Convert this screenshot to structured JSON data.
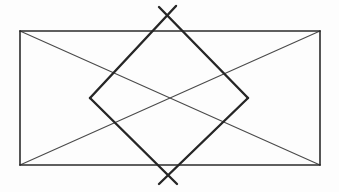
{
  "figure": {
    "kind": "geometric-line-drawing",
    "canvas": {
      "width": 339,
      "height": 192,
      "background": "#fdfdfd"
    },
    "style": {
      "rectangle_stroke": "#2b2b2b",
      "rectangle_stroke_width": 1.6,
      "diagonal_stroke": "#4a4a4a",
      "diagonal_stroke_width": 1.1,
      "diamond_stroke": "#262626",
      "diamond_stroke_width": 2.4,
      "line_cap": "round"
    },
    "rectangle": {
      "label": "outer-rectangle",
      "left": 20,
      "top": 31,
      "right": 320,
      "bottom": 165,
      "width": 300,
      "height": 134,
      "corners": [
        {
          "name": "top-left",
          "x": 20,
          "y": 31
        },
        {
          "name": "top-right",
          "x": 320,
          "y": 31
        },
        {
          "name": "bottom-right",
          "x": 320,
          "y": 165
        },
        {
          "name": "bottom-left",
          "x": 20,
          "y": 165
        }
      ]
    },
    "diagonals": [
      {
        "name": "diagonal-tl-br",
        "x1": 20,
        "y1": 31,
        "x2": 320,
        "y2": 165
      },
      {
        "name": "diagonal-tr-bl",
        "x1": 320,
        "y1": 31,
        "x2": 20,
        "y2": 165
      }
    ],
    "diagonal_intersection": {
      "x": 170,
      "y": 98
    },
    "diamond": {
      "label": "inscribed-rotated-square",
      "vertices": [
        {
          "name": "top-apex",
          "x": 168,
          "y": 13
        },
        {
          "name": "right-vertex",
          "x": 248,
          "y": 98
        },
        {
          "name": "bottom-apex",
          "x": 168,
          "y": 176
        },
        {
          "name": "left-vertex",
          "x": 90,
          "y": 98
        }
      ],
      "edges": [
        {
          "name": "edge-left-to-top",
          "x1": 90,
          "y1": 98,
          "x2": 168,
          "y2": 13
        },
        {
          "name": "edge-top-to-right",
          "x1": 168,
          "y1": 13,
          "x2": 248,
          "y2": 98
        },
        {
          "name": "edge-right-to-bottom",
          "x1": 248,
          "y1": 98,
          "x2": 168,
          "y2": 176
        },
        {
          "name": "edge-bottom-to-left",
          "x1": 168,
          "y1": 176,
          "x2": 90,
          "y2": 98
        }
      ],
      "apex_overshoot": [
        {
          "name": "overshoot-top-left-stroke",
          "x1": 90,
          "y1": 98,
          "x2": 176,
          "y2": 6
        },
        {
          "name": "overshoot-top-right-stroke",
          "x1": 248,
          "y1": 98,
          "x2": 159,
          "y2": 7
        },
        {
          "name": "overshoot-bottom-left-stroke",
          "x1": 90,
          "y1": 98,
          "x2": 177,
          "y2": 184
        },
        {
          "name": "overshoot-bottom-right-stroke",
          "x1": 248,
          "y1": 98,
          "x2": 159,
          "y2": 184
        }
      ],
      "side_vertex_crossings": [
        {
          "name": "left-crossing",
          "x": 90,
          "y": 98
        },
        {
          "name": "right-crossing",
          "x": 248,
          "y": 98
        }
      ]
    }
  }
}
